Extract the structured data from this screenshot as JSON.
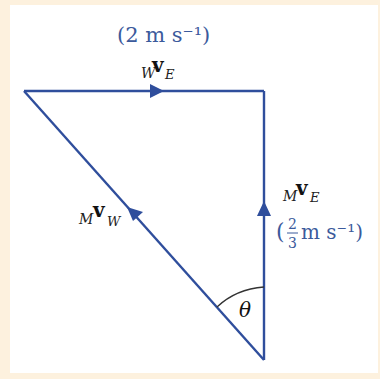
{
  "diagram": {
    "type": "vector-triangle",
    "colors": {
      "background": "#fdf1de",
      "panel": "#ffffff",
      "line": "#2f4e9c",
      "label_blue": "#3b5a9c",
      "vector_bold": "#111111"
    },
    "vectors": [
      {
        "id": "wvE",
        "pre_sub": "W",
        "symbol": "v",
        "post_sub": "E",
        "magnitude": "(2 m s⁻¹)",
        "direction": "right"
      },
      {
        "id": "mvE",
        "pre_sub": "M",
        "symbol": "v",
        "post_sub": "E",
        "magnitude_open": "(",
        "frac_num": "2",
        "frac_den": "3",
        "magnitude_rest": "m s⁻¹)",
        "direction": "up"
      },
      {
        "id": "mvW",
        "pre_sub": "M",
        "symbol": "v",
        "post_sub": "W",
        "direction": "up-left"
      }
    ],
    "angle_label": "θ",
    "vertices": {
      "top_left": [
        24,
        91
      ],
      "top_right": [
        264,
        91
      ],
      "bottom": [
        264,
        360
      ]
    }
  }
}
